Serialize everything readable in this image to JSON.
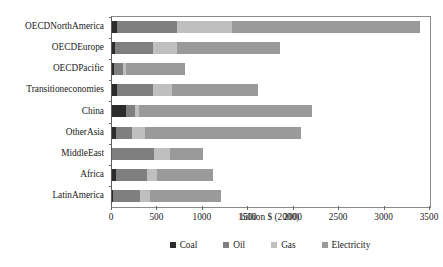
{
  "chart_data": {
    "type": "bar",
    "orientation": "horizontal",
    "stacked": true,
    "title": "",
    "xlabel": "billion $ (2000)",
    "ylabel": "",
    "xlim": [
      0,
      3500
    ],
    "xticks": [
      0,
      500,
      1000,
      1500,
      2000,
      2500,
      3000,
      3500
    ],
    "xtick_labels": [
      "0",
      "500",
      "1000",
      "1500",
      "2000",
      "2500",
      "3000",
      "3500"
    ],
    "grid": false,
    "legend_position": "bottom",
    "categories": [
      "OECDNorthAmerica",
      "OECDEurope",
      "OECDPacific",
      "Transitioneconomies",
      "China",
      "OtherAsia",
      "MiddleEast",
      "Africa",
      "LatinAmerica"
    ],
    "series": [
      {
        "name": "Coal",
        "color": "#2b2b2b",
        "values": [
          60,
          30,
          25,
          55,
          150,
          45,
          5,
          40,
          10
        ]
      },
      {
        "name": "Oil",
        "color": "#7f7f7f",
        "values": [
          660,
          420,
          95,
          400,
          100,
          180,
          460,
          340,
          300
        ]
      },
      {
        "name": "Gas",
        "color": "#bfbfbf",
        "values": [
          600,
          270,
          30,
          205,
          50,
          140,
          175,
          110,
          110
        ]
      },
      {
        "name": "Electricity",
        "color": "#9a9a9a",
        "values": [
          2070,
          1130,
          650,
          950,
          1900,
          1710,
          360,
          620,
          780
        ]
      }
    ],
    "totals": [
      3390,
      1850,
      800,
      1610,
      2200,
      2075,
      1000,
      1110,
      1200
    ]
  },
  "legend": {
    "items": [
      {
        "label": "Coal",
        "color": "#2b2b2b"
      },
      {
        "label": "Oil",
        "color": "#7f7f7f"
      },
      {
        "label": "Gas",
        "color": "#bfbfbf"
      },
      {
        "label": "Electricity",
        "color": "#9a9a9a"
      }
    ]
  }
}
